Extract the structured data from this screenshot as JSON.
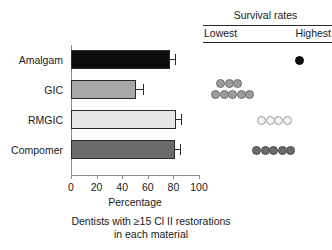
{
  "chart_data": {
    "type": "bar",
    "orientation": "horizontal",
    "title": "",
    "xlabel": "Percentage",
    "ylabel": "",
    "xlim": [
      0,
      100
    ],
    "xticks": [
      0,
      20,
      40,
      60,
      80,
      100
    ],
    "xticklabels": [
      "0",
      "20",
      "40",
      "60",
      "80",
      "100"
    ],
    "grid": false,
    "legend": "none",
    "caption": "Dentists with ≥15 Cl II restorations in each material",
    "categories": [
      "Amalgam",
      "GIC",
      "RMGIC",
      "Compomer"
    ],
    "values": [
      77,
      51,
      82,
      81
    ],
    "errors": [
      4,
      5,
      4,
      4
    ],
    "bar_colors": [
      "#0d0d0d",
      "#a8a8a8",
      "#e6e6e6",
      "#6b6b6b"
    ],
    "bar_edge_color": "#2a2a2a"
  },
  "survival_panel": {
    "title": "Survival rates",
    "lowest_label": "Lowest",
    "highest_label": "Highest",
    "rule_color": "#2a2a2a",
    "rows": [
      {
        "category": "Amalgam",
        "marker_color": "#0d0d0d",
        "marker_edge": "#0d0d0d",
        "count": 1,
        "layout": [
          {
            "x": 96,
            "y": 15,
            "n": 1
          }
        ]
      },
      {
        "category": "GIC",
        "marker_color": "#9c9c9c",
        "marker_edge": "#6f6f6f",
        "count": 8,
        "layout": [
          {
            "x": 17,
            "y": 8,
            "n": 3
          },
          {
            "x": 12,
            "y": 19,
            "n": 5
          }
        ]
      },
      {
        "category": "RMGIC",
        "marker_color": "#f2f2f2",
        "marker_edge": "#9c9c9c",
        "count": 4,
        "layout": [
          {
            "x": 58,
            "y": 15,
            "n": 4
          }
        ]
      },
      {
        "category": "Compomer",
        "marker_color": "#6b6b6b",
        "marker_edge": "#4a4a4a",
        "count": 5,
        "layout": [
          {
            "x": 53,
            "y": 15,
            "n": 5
          }
        ]
      }
    ]
  },
  "axis": {
    "tick_color": "#8d8d8d",
    "x_label": "Percentage"
  },
  "labels": {
    "amalgam": "Amalgam",
    "gic": "GIC",
    "rmgic": "RMGIC",
    "compomer": "Compomer"
  },
  "caption_lines": [
    "Dentists with ≥15 Cl II restorations",
    "in each material"
  ]
}
